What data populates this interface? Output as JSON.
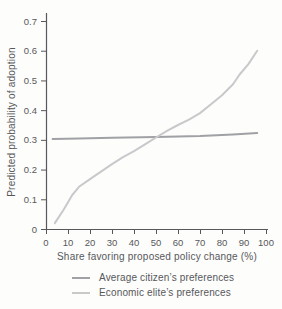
{
  "page": {
    "background": "#fdfdfc"
  },
  "colors": {
    "axis": "#57585b",
    "text": "#57585b"
  },
  "chart_data": {
    "type": "line",
    "title": "",
    "xlabel": "Share favoring proposed policy change (%)",
    "ylabel": "Predicted probability of adoption",
    "xlim": [
      0,
      100
    ],
    "ylim": [
      0,
      0.7
    ],
    "x_ticks": [
      0,
      10,
      20,
      30,
      40,
      50,
      60,
      70,
      80,
      90,
      100
    ],
    "y_ticks": [
      0,
      0.1,
      0.2,
      0.3,
      0.4,
      0.5,
      0.6,
      0.7
    ],
    "grid": false,
    "legend_position": "bottom",
    "series": [
      {
        "name": "Average citizen’s preferences",
        "color": "#9fa1a4",
        "points": [
          [
            3,
            0.303
          ],
          [
            15,
            0.305
          ],
          [
            30,
            0.307
          ],
          [
            50,
            0.31
          ],
          [
            70,
            0.313
          ],
          [
            85,
            0.318
          ],
          [
            96,
            0.323
          ]
        ]
      },
      {
        "name": "Economic elite’s preferences",
        "color": "#c8c9cb",
        "points": [
          [
            4,
            0.02
          ],
          [
            8,
            0.065
          ],
          [
            12,
            0.115
          ],
          [
            15,
            0.142
          ],
          [
            20,
            0.168
          ],
          [
            25,
            0.193
          ],
          [
            30,
            0.218
          ],
          [
            35,
            0.242
          ],
          [
            40,
            0.262
          ],
          [
            45,
            0.285
          ],
          [
            50,
            0.308
          ],
          [
            55,
            0.33
          ],
          [
            60,
            0.35
          ],
          [
            65,
            0.368
          ],
          [
            70,
            0.39
          ],
          [
            75,
            0.42
          ],
          [
            80,
            0.45
          ],
          [
            85,
            0.487
          ],
          [
            88,
            0.52
          ],
          [
            92,
            0.555
          ],
          [
            96,
            0.6
          ]
        ]
      }
    ]
  }
}
